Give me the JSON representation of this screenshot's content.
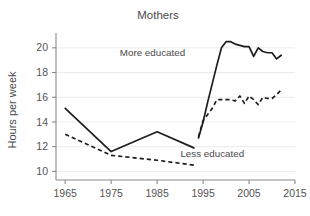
{
  "chart_data": {
    "type": "line",
    "title": "Mothers",
    "xlabel": "",
    "ylabel": "Hours per week",
    "xlim": [
      1963,
      2015
    ],
    "ylim": [
      9.3,
      21.2
    ],
    "xticks": [
      1965,
      1975,
      1985,
      1995,
      2005,
      2015
    ],
    "xtick_labels": [
      "1965",
      "1975",
      "1985",
      "1995",
      "2005",
      "2015"
    ],
    "yticks": [
      10,
      12,
      14,
      16,
      18,
      20
    ],
    "ytick_labels": [
      "10",
      "12",
      "14",
      "16",
      "18",
      "20"
    ],
    "grid": "horizontal",
    "legend_position": "inline-annotations",
    "series": [
      {
        "name": "More educated",
        "style": "solid",
        "annotation": "More educated",
        "annotation_x": 1984.0,
        "annotation_y": 19.3,
        "segments": [
          {
            "x": [
              1965,
              1975,
              1985,
              1993
            ],
            "y": [
              15.1,
              11.6,
              13.2,
              11.9
            ]
          },
          {
            "x": [
              1994,
              1995,
              1996,
              1997,
              1998,
              1999,
              2000,
              2001,
              2002,
              2003,
              2004,
              2005,
              2006,
              2007,
              2008,
              2009,
              2010,
              2011,
              2012
            ],
            "y": [
              12.7,
              14.0,
              15.6,
              17.1,
              18.6,
              20.0,
              20.5,
              20.5,
              20.3,
              20.2,
              20.1,
              20.1,
              19.3,
              20.0,
              19.7,
              19.6,
              19.6,
              19.1,
              19.4
            ]
          }
        ]
      },
      {
        "name": "Less educated",
        "style": "dashed",
        "annotation": "Less educated",
        "annotation_x": 1997.0,
        "annotation_y": 11.2,
        "segments": [
          {
            "x": [
              1965,
              1975,
              1985,
              1993
            ],
            "y": [
              13.0,
              11.3,
              10.9,
              10.5
            ]
          },
          {
            "x": [
              1994,
              1995,
              1996,
              1997,
              1998,
              1999,
              2000,
              2001,
              2002,
              2003,
              2004,
              2005,
              2006,
              2007,
              2008,
              2009,
              2010,
              2011,
              2012
            ],
            "y": [
              12.8,
              14.1,
              14.6,
              15.1,
              15.8,
              15.8,
              15.8,
              15.8,
              15.7,
              16.1,
              15.5,
              16.1,
              15.8,
              15.4,
              16.0,
              15.9,
              15.9,
              16.2,
              16.6
            ]
          }
        ]
      }
    ]
  }
}
